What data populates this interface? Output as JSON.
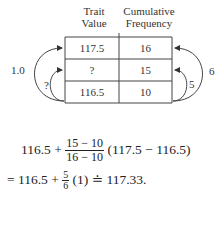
{
  "table": {
    "headers": [
      {
        "line1": "Trait",
        "line2": "Value"
      },
      {
        "line1": "Cumulative",
        "line2": "Frequency"
      }
    ],
    "rows": [
      {
        "trait_value": "117.5",
        "cumulative_frequency": "16"
      },
      {
        "trait_value": "?",
        "cumulative_frequency": "15"
      },
      {
        "trait_value": "116.5",
        "cumulative_frequency": "10"
      }
    ]
  },
  "arrows": {
    "left_outer_label": "1.0",
    "left_inner_label": "?",
    "right_outer_label": "6",
    "right_inner_label": "5"
  },
  "equation": {
    "line1": {
      "lead": "116.5 +",
      "frac_num": "15 − 10",
      "frac_den": "16 − 10",
      "tail": "(117.5 − 116.5)"
    },
    "line2": {
      "lead": "= 116.5 +",
      "frac_num": "5",
      "frac_den": "6",
      "tail": "(1) ≐ 117.33."
    }
  }
}
